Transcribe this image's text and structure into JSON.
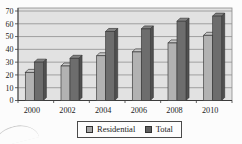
{
  "chart_data": {
    "type": "bar",
    "style": "3d-gray",
    "title": "",
    "xlabel": "",
    "ylabel": "",
    "categories": [
      "2000",
      "2002",
      "2004",
      "2006",
      "2008",
      "2010"
    ],
    "series": [
      {
        "name": "Residential",
        "values": [
          22,
          27,
          35,
          38,
          45,
          51
        ],
        "front_color": "#b2b2b2",
        "top_color": "#c7c7c7",
        "side_color": "#8d8d8d",
        "swatch_color": "#a6a6a6"
      },
      {
        "name": "Total",
        "values": [
          30,
          33,
          54,
          56,
          62,
          66
        ],
        "front_color": "#6d6d6d",
        "top_color": "#828282",
        "side_color": "#505050",
        "swatch_color": "#5f5f5f"
      }
    ],
    "ylim": [
      0,
      70
    ],
    "yticks": [
      0,
      10,
      20,
      30,
      40,
      50,
      60,
      70
    ],
    "grid": true,
    "legend_position": "bottom-center",
    "plot_bg": "#e2e2e2",
    "grid_color": "#8f8f8f",
    "axis_color": "#3c3c3c",
    "outline_color": "#3c3c3c",
    "text_color": "#1c1c1c"
  }
}
